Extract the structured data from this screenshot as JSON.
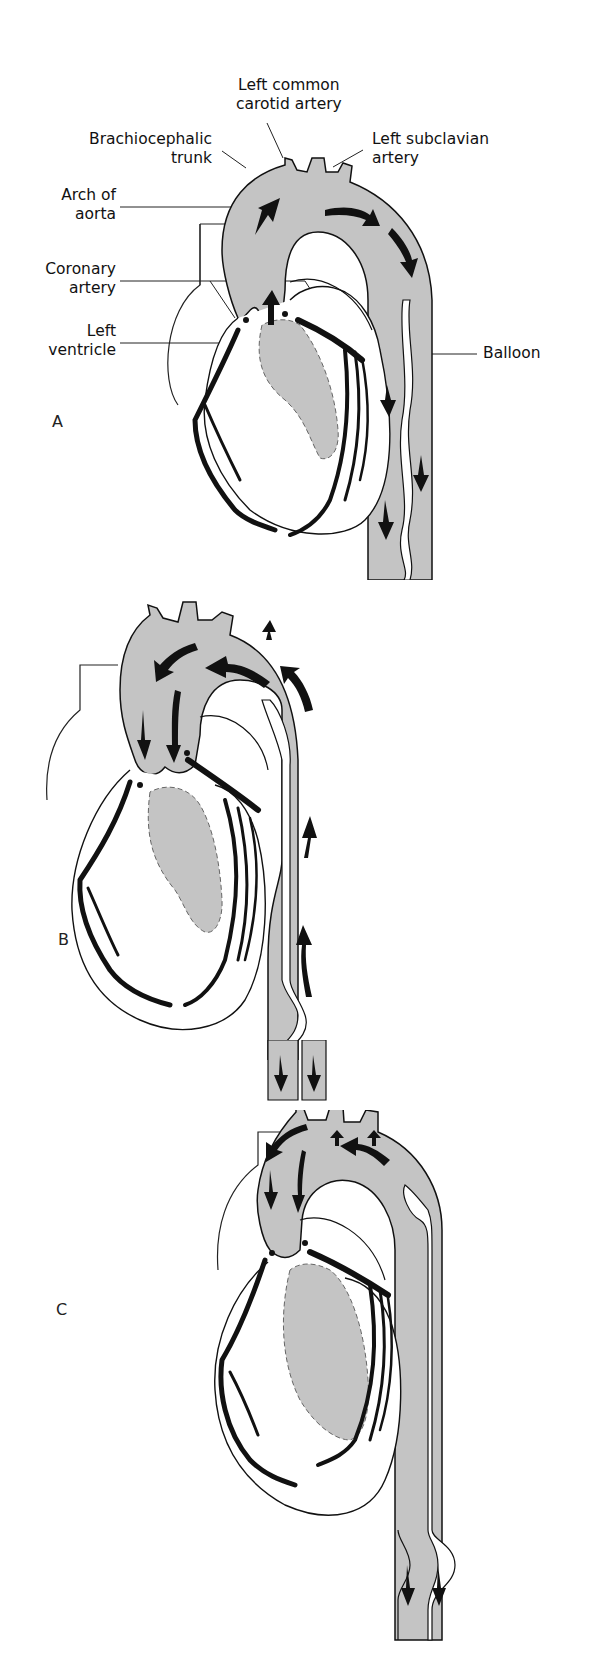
{
  "figure": {
    "colors": {
      "blood_fill": "#c4c4c4",
      "outline": "#111111",
      "background": "#ffffff"
    },
    "labels": {
      "left_common_carotid": [
        "Left common",
        "carotid artery"
      ],
      "brachiocephalic": [
        "Brachiocephalic",
        "trunk"
      ],
      "left_subclavian": [
        "Left subclavian",
        "artery"
      ],
      "arch_of_aorta": [
        "Arch of",
        "aorta"
      ],
      "coronary_artery": [
        "Coronary",
        "artery"
      ],
      "left_ventricle": [
        "Left",
        "ventricle"
      ],
      "balloon": "Balloon"
    },
    "panels": [
      {
        "id": "A",
        "letter": "A",
        "state": "balloon deflated, systole",
        "flow_arrows": "aorta flow directed downward from ventricle"
      },
      {
        "id": "B",
        "letter": "B",
        "state": "balloon inflating, diastole",
        "flow_arrows": "retrograde flow toward coronary arteries and arch vessels"
      },
      {
        "id": "C",
        "letter": "C",
        "state": "balloon fully inflated, diastole",
        "flow_arrows": "flow into coronaries, arch vessels; downstream flow distal to balloon"
      }
    ]
  }
}
